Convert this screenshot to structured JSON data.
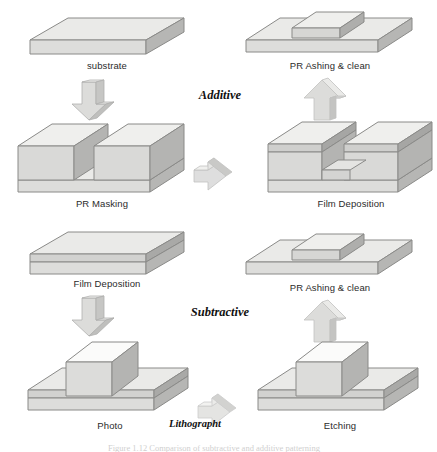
{
  "diagram": {
    "title": "Semiconductor patterning process flow",
    "phases": [
      {
        "id": "additive",
        "label": "Additive"
      },
      {
        "id": "subtractive",
        "label": "Subtractive"
      },
      {
        "id": "lithography",
        "label": "Lithographt"
      }
    ],
    "steps": [
      {
        "id": "substrate",
        "label": "substrate",
        "column": "left",
        "row": 1
      },
      {
        "id": "pr-masking",
        "label": "PR Masking",
        "column": "left",
        "row": 2
      },
      {
        "id": "film-deposition-add",
        "label": "Film Deposition",
        "column": "right",
        "row": 2
      },
      {
        "id": "pr-ashing-clean-add",
        "label": "PR Ashing & clean",
        "column": "right",
        "row": 1
      },
      {
        "id": "film-deposition-sub",
        "label": "Film Deposition",
        "column": "left",
        "row": 3
      },
      {
        "id": "photo",
        "label": "Photo",
        "column": "left",
        "row": 4
      },
      {
        "id": "etching",
        "label": "Etching",
        "column": "right",
        "row": 4
      },
      {
        "id": "pr-ashing-clean-sub",
        "label": "PR Ashing & clean",
        "column": "right",
        "row": 3
      }
    ],
    "arrows": [
      {
        "id": "arrow-substrate-to-pr-masking",
        "direction": "down"
      },
      {
        "id": "arrow-pr-masking-to-film-deposition",
        "direction": "right"
      },
      {
        "id": "arrow-film-deposition-to-pr-ashing",
        "direction": "up"
      },
      {
        "id": "arrow-film-deposition-to-photo",
        "direction": "down"
      },
      {
        "id": "arrow-photo-to-etching",
        "direction": "right"
      },
      {
        "id": "arrow-etching-to-pr-ashing",
        "direction": "up"
      }
    ],
    "bottom_caption": "Figure 1.12  Comparison of subtractive and additive patterning",
    "colors": {
      "top_face": "#e8e8e6",
      "front_face": "#d8d8d6",
      "side_face": "#b9b9b7",
      "outline": "#8a8a88",
      "arrow_light": "#e2e2e0",
      "arrow_mid": "#cfcfcd",
      "arrow_dark": "#a9a9a7",
      "text": "#2b2b2b",
      "background": "#ffffff"
    }
  }
}
